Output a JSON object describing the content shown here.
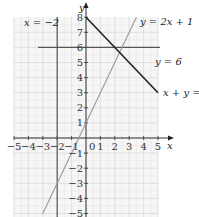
{
  "chart_data": {
    "type": "line",
    "title": "",
    "xlabel": "x",
    "ylabel": "y",
    "xlim": [
      -5,
      5
    ],
    "ylim": [
      -5,
      8
    ],
    "grid": true,
    "x_ticks": [
      "-5",
      "-4",
      "-3",
      "-2",
      "-1",
      "0",
      "1",
      "2",
      "3",
      "4",
      "5"
    ],
    "y_ticks": [
      "8",
      "7",
      "6",
      "5",
      "4",
      "3",
      "2",
      "1",
      "-1",
      "-2",
      "-3",
      "-4",
      "-5"
    ],
    "origin_label": "0",
    "series": [
      {
        "name": "x = −2",
        "equation": "x = -2",
        "type": "vertical",
        "x": -2,
        "color": "#555555"
      },
      {
        "name": "y = 6",
        "equation": "y = 6",
        "type": "horizontal",
        "y": 6,
        "color": "#555555"
      },
      {
        "name": "y = 2x + 1",
        "equation": "y = 2x + 1",
        "type": "line",
        "points": [
          [
            -3,
            -5
          ],
          [
            1.5,
            4
          ],
          [
            3.5,
            8
          ]
        ],
        "color": "#999999"
      },
      {
        "name": "x + y = 8",
        "equation": "x + y = 8",
        "type": "line",
        "points": [
          [
            0,
            8
          ],
          [
            5,
            3
          ]
        ],
        "color": "#222222"
      }
    ],
    "annotations": [
      {
        "text": "x = −2",
        "position": "upper-left"
      },
      {
        "text": "y = 2x + 1",
        "position": "upper-right"
      },
      {
        "text": "y = 6",
        "position": "right of y=6 line"
      },
      {
        "text": "x + y = 8",
        "position": "end of line at x=5"
      }
    ]
  },
  "labels": {
    "x_axis": "x",
    "y_axis": "y",
    "origin": "0",
    "eq_vertical": "x = −2",
    "eq_horizontal": "y = 6",
    "eq_steep": "y = 2x + 1",
    "eq_sum": "x + y = 8"
  }
}
